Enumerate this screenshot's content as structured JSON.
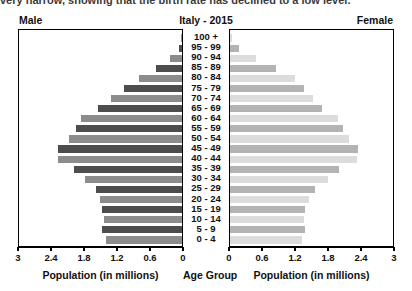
{
  "caption": {
    "text": "very narrow, showing that the birth rate has declined to a low level."
  },
  "header": {
    "male_label": "Male",
    "title": "Italy - 2015",
    "female_label": "Female"
  },
  "footer": {
    "left_axis_label": "Population (in millions)",
    "center_label": "Age Group",
    "right_axis_label": "Population (in millions)"
  },
  "colors": {
    "male_dark": "#4d4d4d",
    "male_light": "#8c8c8c",
    "female_dark": "#b3b3b3",
    "female_light": "#dcdcdc",
    "axis": "#000000",
    "text": "#111111"
  },
  "chart_data": {
    "type": "bar",
    "subtype": "population-pyramid",
    "title": "Italy - 2015",
    "xlabel": "Population (in millions)",
    "ylabel": "Age Group",
    "xlim": [
      0,
      3
    ],
    "left_axis_direction": "reversed",
    "grid": false,
    "legend_position": "top-corners",
    "tick_values": [
      3,
      2.4,
      1.8,
      1.2,
      0.6,
      0
    ],
    "left_tick_labels": [
      "3",
      "2.4",
      "1.8",
      "1.2",
      "0.6",
      "0"
    ],
    "right_tick_labels": [
      "0",
      "0.6",
      "1.2",
      "1.8",
      "2.4",
      "3"
    ],
    "categories": [
      "100 +",
      "95 - 99",
      "90 - 94",
      "85 - 89",
      "80 - 84",
      "75 - 79",
      "70 - 74",
      "65 - 69",
      "60 - 64",
      "55 - 59",
      "50 - 54",
      "45 - 49",
      "40 - 44",
      "35 - 39",
      "30 - 34",
      "25 - 29",
      "20 - 24",
      "15 - 19",
      "10 - 14",
      "5 - 9",
      "0 - 4"
    ],
    "series": [
      {
        "name": "Male",
        "side": "left",
        "values": [
          0.01,
          0.06,
          0.22,
          0.48,
          0.78,
          1.06,
          1.29,
          1.52,
          1.84,
          1.93,
          2.06,
          2.25,
          2.26,
          1.96,
          1.76,
          1.56,
          1.49,
          1.45,
          1.42,
          1.45,
          1.38
        ]
      },
      {
        "name": "Female",
        "side": "right",
        "values": [
          0.03,
          0.17,
          0.47,
          0.84,
          1.18,
          1.35,
          1.5,
          1.68,
          1.97,
          2.05,
          2.17,
          2.33,
          2.3,
          1.99,
          1.78,
          1.55,
          1.44,
          1.37,
          1.34,
          1.37,
          1.31
        ]
      }
    ]
  }
}
